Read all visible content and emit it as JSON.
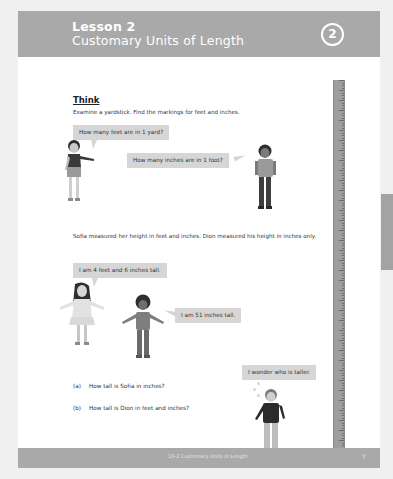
{
  "header": {
    "lesson_number": "Lesson 2",
    "lesson_title": "Customary Units of Length",
    "badge": "2",
    "band_color": "#a9a9a9"
  },
  "think": {
    "title": "Think",
    "intro": "Examine a yardstick. Find the markings for feet and inches.",
    "bubble_girl_1": "How many feet are in 1 yard?",
    "bubble_boy_1": "How many inches are in 1 foot?",
    "paragraph": "Sofia measured her height in feet and inches. Dion measured his height in inches only.",
    "bubble_sofia": "I am 4 feet and 6 inches tall.",
    "bubble_dion": "I am 51 inches tall.",
    "bubble_thinker": "I wonder who is taller.",
    "questions": [
      {
        "label": "(a)",
        "text": "How tall is Sofia in inches?"
      },
      {
        "label": "(b)",
        "text": "How tall is Dion in feet and inches?"
      }
    ]
  },
  "ruler": {
    "type": "yardstick",
    "color": "#9e9e9e"
  },
  "footer": {
    "title": "10-2 Customary Units of Length",
    "page": "7"
  }
}
